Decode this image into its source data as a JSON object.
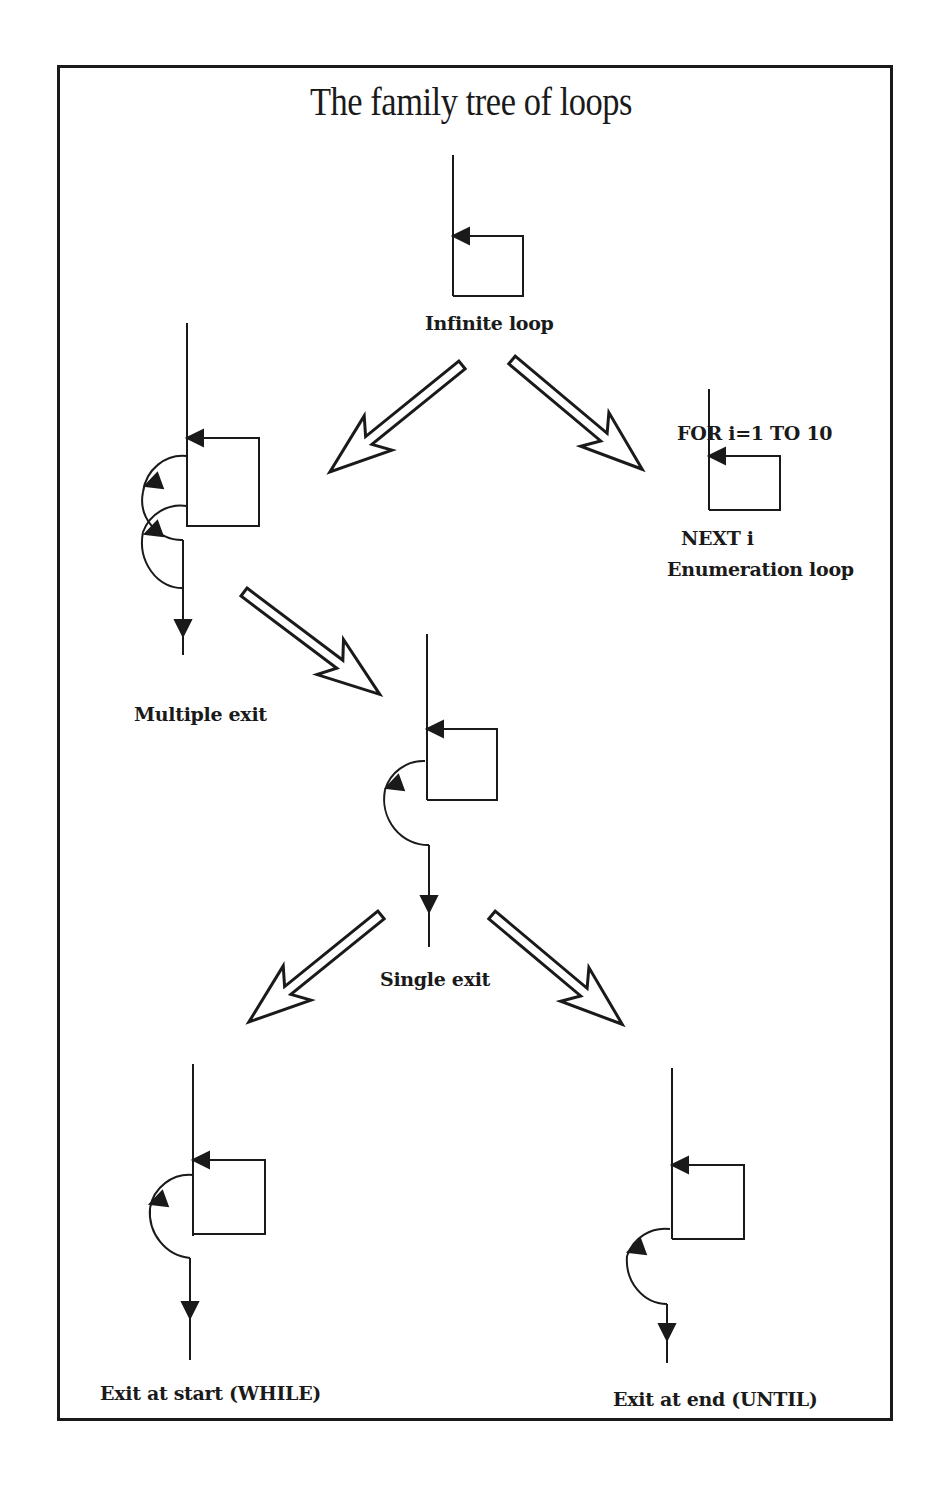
{
  "title": "The family tree of loops",
  "colors": {
    "ink": "#1a1a1a",
    "background": "#ffffff"
  },
  "nodes": {
    "infinite": {
      "label": "Infinite loop"
    },
    "multiple_exit": {
      "label": "Multiple exit"
    },
    "enumeration": {
      "label": "Enumeration loop",
      "code_start": "FOR i=1  TO 10",
      "code_end": "NEXT i"
    },
    "single_exit": {
      "label": "Single exit"
    },
    "while": {
      "label": "Exit at start (WHILE)"
    },
    "until": {
      "label": "Exit at end (UNTIL)"
    }
  },
  "edges": [
    {
      "from": "Infinite loop",
      "to": "Multiple exit",
      "icon": "hollow-arrow-icon"
    },
    {
      "from": "Infinite loop",
      "to": "Enumeration loop",
      "icon": "hollow-arrow-icon"
    },
    {
      "from": "Multiple exit",
      "to": "Single exit",
      "icon": "hollow-arrow-icon"
    },
    {
      "from": "Single exit",
      "to": "Exit at start (WHILE)",
      "icon": "hollow-arrow-icon"
    },
    {
      "from": "Single exit",
      "to": "Exit at end (UNTIL)",
      "icon": "hollow-arrow-icon"
    }
  ]
}
